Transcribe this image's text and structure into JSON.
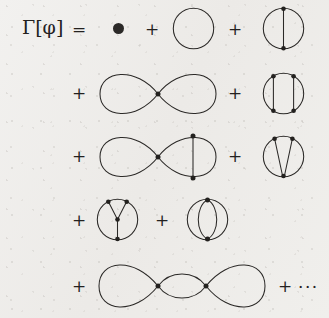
{
  "figure": {
    "kind": "feynman-diagram-expansion",
    "equation_label": "Γ[φ]",
    "equals_sign": "=",
    "plus_sign": "+",
    "ellipsis": "···",
    "ink_color": "#2b2927",
    "paper_color": "#efeeec",
    "vertex_color": "#23211f"
  },
  "terms": [
    {
      "id": "term-tadpole-dot",
      "name": "filled-dot",
      "row": 1,
      "description": "single filled vertex dot",
      "vertices": 1,
      "loops": 0
    },
    {
      "id": "term-single-loop",
      "name": "bare-circle",
      "row": 1,
      "description": "single closed loop, no vertices",
      "vertices": 0,
      "loops": 1
    },
    {
      "id": "term-circle-one-chord",
      "name": "circle-with-one-chord",
      "row": 1,
      "description": "circle with one vertical chord joining two vertices",
      "vertices": 2,
      "loops": 2
    },
    {
      "id": "term-figure-eight",
      "name": "figure-eight",
      "row": 2,
      "description": "two loops meeting at one central vertex",
      "vertices": 1,
      "loops": 2
    },
    {
      "id": "term-circle-two-chords",
      "name": "circle-with-two-chords",
      "row": 2,
      "description": "circle with two parallel vertical chords, four vertices",
      "vertices": 4,
      "loops": 3
    },
    {
      "id": "term-figure-eight-chord",
      "name": "figure-eight-with-chord",
      "row": 3,
      "description": "figure eight with a vertical chord across the right loop",
      "vertices": 3,
      "loops": 3
    },
    {
      "id": "term-circle-v-chords",
      "name": "circle-with-v-chords",
      "row": 3,
      "description": "circle with two chords from top vertices meeting at a bottom vertex",
      "vertices": 3,
      "loops": 3
    },
    {
      "id": "term-circle-y-chords",
      "name": "circle-with-y-chords",
      "row": 4,
      "description": "circle with Y shaped internal lines, four vertices",
      "vertices": 4,
      "loops": 3
    },
    {
      "id": "term-watermelon",
      "name": "watermelon-four-propagators",
      "row": 4,
      "description": "two vertices joined by four arcs",
      "vertices": 2,
      "loops": 3
    },
    {
      "id": "term-triple-loop-chain",
      "name": "triple-loop-chain",
      "row": 5,
      "description": "two vertices with two outer loops and a central lens",
      "vertices": 2,
      "loops": 3
    }
  ],
  "operators": {
    "row1": [
      "=",
      "+",
      "+"
    ],
    "row2": [
      "+",
      "+"
    ],
    "row3": [
      "+",
      "+"
    ],
    "row4": [
      "+",
      "+"
    ],
    "row5": [
      "+",
      "+"
    ],
    "tail": "···"
  }
}
